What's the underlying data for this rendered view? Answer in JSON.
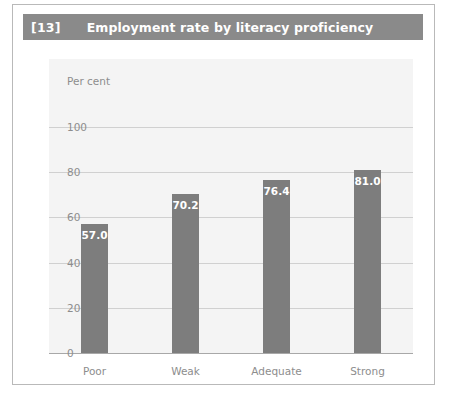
{
  "figure": {
    "number_label": "[13]",
    "title": "Employment rate by literacy proficiency"
  },
  "colors": {
    "title_bar": "#8a8a8a",
    "bar": "#7d7d7d",
    "panel": "#f4f4f4",
    "gridline": "#d0d0d0",
    "axis_text": "#8d8d8d",
    "frame_border": "#b9b9b9",
    "label_text": "#ffffff"
  },
  "chart_data": {
    "type": "bar",
    "title": "Employment rate by literacy proficiency",
    "categories": [
      "Poor",
      "Weak",
      "Adequate",
      "Strong"
    ],
    "values": [
      57.0,
      70.2,
      76.4,
      81.0
    ],
    "value_labels": [
      "57.0",
      "70.2",
      "76.4",
      "81.0"
    ],
    "xlabel": "",
    "ylabel": "Per cent",
    "ylim": [
      0,
      100
    ],
    "yticks": [
      0,
      20,
      40,
      60,
      80,
      100
    ],
    "ytick_labels": [
      "0",
      "20",
      "40",
      "60",
      "80",
      "100"
    ],
    "grid": true,
    "legend": false
  }
}
